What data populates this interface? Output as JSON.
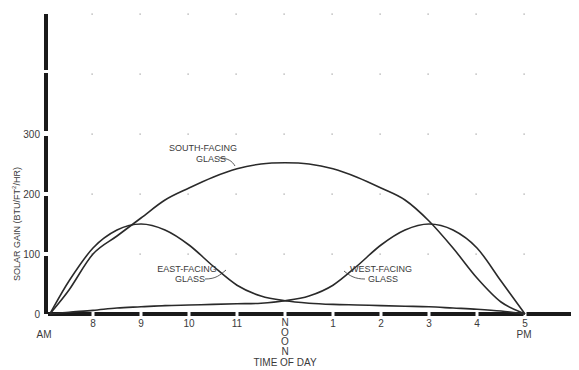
{
  "chart_data": {
    "type": "line",
    "title": "",
    "xlabel": "TIME OF DAY",
    "ylabel": "SOLAR GAIN (BTU/FT²/HR)",
    "ylabel_parts": {
      "main": "SOLAR GAIN (BTU/FT",
      "sup": "2",
      "end": "/HR)"
    },
    "ylim": [
      0,
      500
    ],
    "y_ticks": [
      0,
      100,
      200,
      300
    ],
    "x_ticks": [
      "8",
      "9",
      "10",
      "11",
      "NOON",
      "1",
      "2",
      "3",
      "4",
      "5"
    ],
    "x_tick_hours": [
      8,
      9,
      10,
      11,
      12,
      13,
      14,
      15,
      16,
      17
    ],
    "x_am_label": "AM",
    "x_pm_label": "PM",
    "grid": "dots",
    "legend": "inline annotations",
    "x": [
      7.1,
      7.5,
      8,
      8.5,
      9,
      9.5,
      10,
      10.5,
      11,
      11.5,
      12,
      12.5,
      13,
      13.5,
      14,
      14.5,
      15,
      15.5,
      16,
      16.5,
      17
    ],
    "series": [
      {
        "name": "SOUTH-FACING GLASS",
        "label_lines": [
          "SOUTH-FACING",
          "GLASS"
        ],
        "values": [
          0,
          40,
          100,
          130,
          160,
          190,
          210,
          228,
          242,
          250,
          252,
          250,
          242,
          228,
          210,
          190,
          155,
          110,
          60,
          20,
          0
        ]
      },
      {
        "name": "EAST-FACING GLASS",
        "label_lines": [
          "EAST-FACING",
          "GLASS"
        ],
        "values": [
          0,
          55,
          110,
          140,
          150,
          140,
          115,
          80,
          48,
          30,
          22,
          18,
          16,
          15,
          14,
          13,
          12,
          10,
          8,
          5,
          0
        ]
      },
      {
        "name": "WEST-FACING GLASS",
        "label_lines": [
          "WEST-FACING",
          "GLASS"
        ],
        "values": [
          0,
          3,
          6,
          10,
          12,
          14,
          15,
          16,
          17,
          18,
          22,
          30,
          48,
          80,
          115,
          140,
          150,
          140,
          110,
          55,
          0
        ]
      }
    ]
  }
}
